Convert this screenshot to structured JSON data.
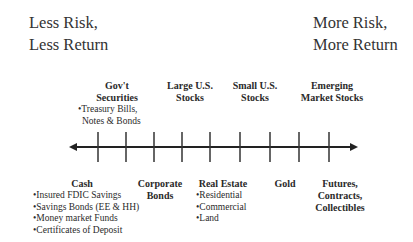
{
  "corners": {
    "left": {
      "line1": "Less Risk,",
      "line2": "Less Return"
    },
    "right": {
      "line1": "More Risk,",
      "line2": "More Return"
    }
  },
  "top_categories": [
    {
      "line1": "Gov't",
      "line2": "Securities",
      "bullets": [
        "•Treasury Bills,",
        "Notes & Bonds"
      ]
    },
    {
      "line1": "Large U.S.",
      "line2": "Stocks"
    },
    {
      "line1": "Small U.S.",
      "line2": "Stocks"
    },
    {
      "line1": "Emerging",
      "line2": "Market Stocks"
    }
  ],
  "bottom_categories": [
    {
      "line1": "Cash",
      "bullets": [
        "•Insured FDIC Savings",
        "•Savings Bonds (EE & HH)",
        "•Money market Funds",
        "•Certificates of Deposit"
      ]
    },
    {
      "line1": "Corporate",
      "line2": "Bonds"
    },
    {
      "line1": "Real Estate",
      "bullets": [
        "•Residential",
        "•Commercial",
        "•Land"
      ]
    },
    {
      "line1": "Gold"
    },
    {
      "line1": "Futures,",
      "line2": "Contracts,",
      "line3": "Collectibles"
    }
  ],
  "axis": {
    "direction": "left-to-right increasing risk and return",
    "tick_count": 9,
    "color": "#222222"
  }
}
